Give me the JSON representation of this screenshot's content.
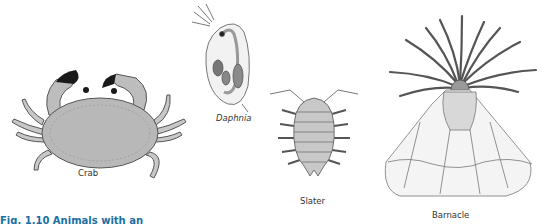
{
  "figure": {
    "caption": "Fig. 1.10 Animals with an",
    "caption_color": "#1a6fa3",
    "animals": [
      {
        "name": "Crab",
        "italic": false
      },
      {
        "name": "Daphnia",
        "italic": true
      },
      {
        "name": "Slater",
        "italic": false
      },
      {
        "name": "Barnacle",
        "italic": false
      }
    ]
  },
  "colors": {
    "body_gray": "#b8b8b8",
    "light_gray": "#d8d8d8",
    "outline": "#555555",
    "claw_black": "#1a1a1a",
    "label_text": "#333333"
  }
}
